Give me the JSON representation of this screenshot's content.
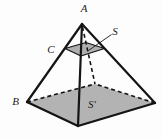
{
  "figure": {
    "background": "#fdfdfd",
    "line_color": "#141414",
    "base_fill": "#b3b3b3",
    "section_fill": "#aeaeae"
  },
  "labels": [
    {
      "id": "vertex-a",
      "text": "A",
      "x": 84,
      "y": 8
    },
    {
      "id": "vertex-c",
      "text": "C",
      "x": 51,
      "y": 49
    },
    {
      "id": "point-s",
      "text": "S",
      "x": 115,
      "y": 30.5
    },
    {
      "id": "vertex-b",
      "text": "B",
      "x": 15.5,
      "y": 100.5
    },
    {
      "id": "point-s-prime",
      "text": "S′",
      "x": 92,
      "y": 103.5
    }
  ],
  "geometry": {
    "apex": [
      82,
      24
    ],
    "base": [
      [
        27,
        102
      ],
      [
        78,
        126
      ],
      [
        155,
        103
      ],
      [
        95,
        84
      ]
    ],
    "section": [
      [
        65,
        48.5
      ],
      [
        81,
        56
      ],
      [
        104.5,
        48.5
      ],
      [
        86,
        42.5
      ]
    ],
    "hidden_edge": [
      [
        82.5,
        27
      ],
      [
        95,
        84
      ]
    ],
    "leader": [
      [
        111.5,
        34.5
      ],
      [
        88.5,
        50.5
      ]
    ],
    "stroke_widths": {
      "lateral": 2.2,
      "base_front": 2.3,
      "base_back_dashed": 1.6,
      "section": 1.3,
      "hidden_dashed": 1.6,
      "leader": 0.9
    },
    "dash_pattern": "4 3"
  }
}
